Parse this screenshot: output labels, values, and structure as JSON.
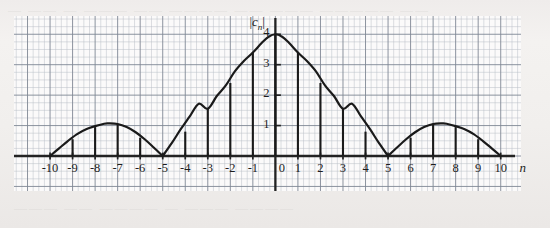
{
  "figure": {
    "kind": "hand-drawn-graph-on-grid-paper",
    "paper_bleed_top": "— —— — ———  —— ———— ——  ——— ————— ——",
    "paper_bleed_bottom": "——— —— ———— — ———  ————"
  },
  "chart_data": {
    "type": "bar",
    "title": "",
    "subtitle": "",
    "xlabel": "n",
    "ylabel": "|cₙ|",
    "ylabel_parts": {
      "left_bar": "|",
      "symbol": "c",
      "subscript": "n",
      "right_bar": "|"
    },
    "grid": true,
    "grid_minor_step": 0.25,
    "grid_major_step": 1,
    "legend": null,
    "xlim": [
      -11.6,
      10.9
    ],
    "ylim": [
      -1.15,
      4.6
    ],
    "xticks": [
      -10,
      -9,
      -8,
      -7,
      -6,
      -5,
      -4,
      -3,
      -2,
      -1,
      0,
      1,
      2,
      3,
      4,
      5,
      6,
      7,
      8,
      9,
      10
    ],
    "xticklabels": [
      "-10",
      "-9",
      "-8",
      "-7",
      "-6",
      "-5",
      "-4",
      "-3",
      "-2",
      "-1",
      "0",
      "1",
      "2",
      "3",
      "4",
      "5",
      "6",
      "7",
      "8",
      "9",
      "10"
    ],
    "yticks": [
      1,
      2,
      3,
      4
    ],
    "yticklabels": [
      "1",
      "2",
      "3",
      "4"
    ],
    "categories": [
      -10,
      -9,
      -8,
      -7,
      -6,
      -5,
      -4,
      -3,
      -2,
      -1,
      0,
      1,
      2,
      3,
      4,
      5,
      6,
      7,
      8,
      9,
      10
    ],
    "values": [
      0,
      0.55,
      0.95,
      1.05,
      0.6,
      0,
      0.8,
      1.55,
      2.4,
      3.4,
      4.0,
      3.4,
      2.4,
      1.55,
      0.8,
      0,
      0.6,
      1.05,
      0.95,
      0.55,
      0
    ],
    "envelope": {
      "description": "continuous |sinc|-like envelope through the stem tips, touching zero at n = -5, 0 lobes, +5",
      "zeros": [
        -10,
        -5,
        5,
        10
      ],
      "peak": {
        "n": 0,
        "value": 4.0
      },
      "side_lobe_peaks": [
        {
          "n": -7.4,
          "value": 1.07
        },
        {
          "n": 7.4,
          "value": 1.07
        }
      ],
      "points": [
        [
          -10.0,
          0.0
        ],
        [
          -9.6,
          0.25
        ],
        [
          -9.2,
          0.5
        ],
        [
          -8.8,
          0.72
        ],
        [
          -8.4,
          0.88
        ],
        [
          -8.0,
          0.98
        ],
        [
          -7.6,
          1.06
        ],
        [
          -7.4,
          1.07
        ],
        [
          -7.0,
          1.05
        ],
        [
          -6.6,
          0.95
        ],
        [
          -6.2,
          0.78
        ],
        [
          -5.8,
          0.55
        ],
        [
          -5.4,
          0.28
        ],
        [
          -5.0,
          0.0
        ],
        [
          -4.6,
          0.42
        ],
        [
          -4.2,
          0.88
        ],
        [
          -3.8,
          1.3
        ],
        [
          -3.4,
          1.72
        ],
        [
          -3.0,
          1.55
        ],
        [
          -2.6,
          1.97
        ],
        [
          -2.2,
          2.32
        ],
        [
          -1.8,
          2.78
        ],
        [
          -1.4,
          3.12
        ],
        [
          -1.0,
          3.4
        ],
        [
          -0.6,
          3.72
        ],
        [
          -0.3,
          3.92
        ],
        [
          0.0,
          4.0
        ],
        [
          0.3,
          3.92
        ],
        [
          0.6,
          3.72
        ],
        [
          1.0,
          3.4
        ],
        [
          1.4,
          3.12
        ],
        [
          1.8,
          2.78
        ],
        [
          2.2,
          2.32
        ],
        [
          2.6,
          1.97
        ],
        [
          3.0,
          1.55
        ],
        [
          3.4,
          1.72
        ],
        [
          3.8,
          1.3
        ],
        [
          4.2,
          0.88
        ],
        [
          4.6,
          0.42
        ],
        [
          5.0,
          0.0
        ],
        [
          5.4,
          0.28
        ],
        [
          5.8,
          0.55
        ],
        [
          6.2,
          0.78
        ],
        [
          6.6,
          0.95
        ],
        [
          7.0,
          1.05
        ],
        [
          7.4,
          1.07
        ],
        [
          7.6,
          1.06
        ],
        [
          8.0,
          0.98
        ],
        [
          8.4,
          0.88
        ],
        [
          8.8,
          0.72
        ],
        [
          9.2,
          0.5
        ],
        [
          9.6,
          0.25
        ],
        [
          10.0,
          0.0
        ]
      ]
    },
    "stems": [
      {
        "n": -9,
        "value": 0.55
      },
      {
        "n": -8,
        "value": 0.95
      },
      {
        "n": -7,
        "value": 1.05
      },
      {
        "n": -6,
        "value": 0.6
      },
      {
        "n": -4,
        "value": 0.8
      },
      {
        "n": -3,
        "value": 1.55
      },
      {
        "n": -2,
        "value": 2.4
      },
      {
        "n": -1,
        "value": 3.4
      },
      {
        "n": 0,
        "value": 4.0
      },
      {
        "n": 1,
        "value": 3.4
      },
      {
        "n": 2,
        "value": 2.4
      },
      {
        "n": 3,
        "value": 1.55
      },
      {
        "n": 4,
        "value": 0.8
      },
      {
        "n": 6,
        "value": 0.6
      },
      {
        "n": 7,
        "value": 1.05
      },
      {
        "n": 8,
        "value": 0.95
      },
      {
        "n": 9,
        "value": 0.55
      }
    ],
    "colors": {
      "paper": "#f2f0ee",
      "plot_bg": "#fbfafa",
      "grid_minor": "#b9bec7",
      "grid_major": "#7f8794",
      "axis": "#232323",
      "curve": "#1a1a1a",
      "stem": "#1a1a1a",
      "text": "#1d1d1d"
    }
  }
}
